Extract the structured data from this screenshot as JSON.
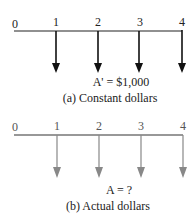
{
  "diagrams": [
    {
      "id": "a",
      "periods": [
        "0",
        "1",
        "2",
        "3",
        "4"
      ],
      "equation": "A' = $1,000",
      "caption": "(a) Constant dollars",
      "arrow_color": "#111111",
      "arrow_direction": "down",
      "arrows_at_periods": [
        1,
        2,
        3,
        4
      ]
    },
    {
      "id": "b",
      "periods": [
        "0",
        "1",
        "2",
        "3",
        "4"
      ],
      "equation": "A = ?",
      "caption": "(b) Actual dollars",
      "arrow_color": "#888888",
      "arrow_direction": "down",
      "arrows_at_periods": [
        1,
        2,
        3,
        4
      ]
    }
  ]
}
